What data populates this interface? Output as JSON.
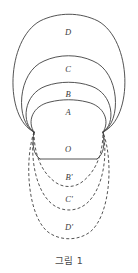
{
  "figure": {
    "caption": "그림 1",
    "caption_y": 253,
    "stroke_color": "#3f3f3f",
    "stroke_width": 0.9,
    "dash_pattern": "3,2.2",
    "pinch_left": {
      "x": 34,
      "y": 132
    },
    "pinch_right": {
      "x": 103,
      "y": 132
    },
    "base_chord_y": 160,
    "solid_arcs": [
      {
        "id": "arc-d",
        "label": "D",
        "top_y": 18,
        "left_x": 10,
        "right_x": 128,
        "label_x": 68,
        "label_y": 33
      },
      {
        "id": "arc-c",
        "label": "C",
        "top_y": 58,
        "left_x": 21,
        "right_x": 117,
        "label_x": 68,
        "label_y": 70
      },
      {
        "id": "arc-b",
        "label": "B",
        "top_y": 83,
        "left_x": 27,
        "right_x": 111,
        "label_x": 68,
        "label_y": 95
      },
      {
        "id": "arc-a",
        "label": "A",
        "top_y": 100,
        "left_x": 32,
        "right_x": 106,
        "label_x": 68,
        "label_y": 113
      }
    ],
    "region_o": {
      "id": "region-o",
      "label": "O",
      "label_x": 68,
      "label_y": 150
    },
    "dashed_arcs": [
      {
        "id": "arc-b-prime",
        "label": "B'",
        "bottom_y": 190,
        "left_x": 39,
        "right_x": 99,
        "label_x": 69,
        "label_y": 178
      },
      {
        "id": "arc-c-prime",
        "label": "C'",
        "bottom_y": 214,
        "left_x": 32,
        "right_x": 106,
        "label_x": 69,
        "label_y": 200
      },
      {
        "id": "arc-d-prime",
        "label": "D'",
        "bottom_y": 242,
        "left_x": 27,
        "right_x": 112,
        "label_x": 69,
        "label_y": 228
      }
    ]
  }
}
